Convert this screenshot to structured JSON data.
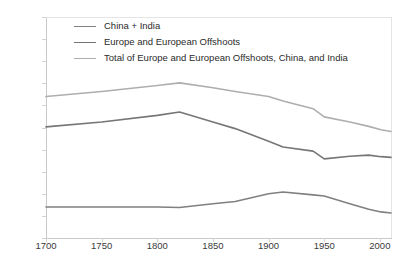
{
  "chart_data": {
    "type": "line",
    "title": "",
    "subtitle": "",
    "xlabel": "",
    "ylabel": "",
    "xlim": [
      1700,
      2010
    ],
    "ylim": [
      0,
      100
    ],
    "grid": false,
    "legend_position": "inside top-left",
    "y_tick_labels": [
      "100%",
      "90%",
      "80%",
      "70%",
      "60%",
      "50%",
      "40%",
      "30%",
      "20%",
      "10%",
      "0%"
    ],
    "y_tick_values": [
      100,
      90,
      80,
      70,
      60,
      50,
      40,
      30,
      20,
      10,
      0
    ],
    "x_tick_labels": [
      "1700",
      "1750",
      "1800",
      "1850",
      "1900",
      "1950",
      "2000"
    ],
    "x_tick_values": [
      1700,
      1750,
      1800,
      1850,
      1900,
      1950,
      2000
    ],
    "series": [
      {
        "name": "China + India",
        "color": "#808080",
        "x": [
          1700,
          1750,
          1800,
          1820,
          1850,
          1870,
          1900,
          1913,
          1940,
          1950,
          1973,
          1990,
          2001,
          2010
        ],
        "values": [
          14.0,
          14.0,
          14.0,
          13.8,
          15.5,
          16.5,
          20.0,
          20.8,
          19.5,
          19.0,
          15.5,
          13.0,
          11.8,
          11.3
        ]
      },
      {
        "name": "Europe and European Offshoots",
        "color": "#767676",
        "x": [
          1700,
          1750,
          1800,
          1820,
          1850,
          1870,
          1900,
          1913,
          1940,
          1950,
          1973,
          1990,
          2001,
          2010
        ],
        "values": [
          50.3,
          52.5,
          55.5,
          57.0,
          52.5,
          49.5,
          43.8,
          41.2,
          39.3,
          35.8,
          37.0,
          37.5,
          36.8,
          36.5
        ]
      },
      {
        "name": "Total of Europe and European Offshoots, China, and India",
        "color": "#aeaeae",
        "x": [
          1700,
          1750,
          1800,
          1820,
          1850,
          1870,
          1900,
          1913,
          1940,
          1950,
          1973,
          1990,
          2001,
          2010
        ],
        "values": [
          64.0,
          66.3,
          69.0,
          70.2,
          68.0,
          66.3,
          64.0,
          62.0,
          58.5,
          54.8,
          52.5,
          50.5,
          49.0,
          48.2
        ]
      }
    ]
  },
  "legend": {
    "items": [
      {
        "label": "China + India",
        "color": "#808080"
      },
      {
        "label": "Europe and European Offshoots",
        "color": "#767676"
      },
      {
        "label": "Total of Europe and European Offshoots, China, and India",
        "color": "#aeaeae"
      }
    ]
  },
  "axes": {
    "y": {
      "labels": [
        "100%",
        "90%",
        "80%",
        "70%",
        "60%",
        "50%",
        "40%",
        "30%",
        "20%",
        "10%",
        "0%"
      ]
    },
    "x": {
      "labels": [
        "1700",
        "1750",
        "1800",
        "1850",
        "1900",
        "1950",
        "2000"
      ]
    }
  },
  "colors": {
    "axis": "#c9c9c9",
    "tick": "#d2d2d2",
    "text": "#3a3a3a",
    "background": "#ffffff"
  }
}
